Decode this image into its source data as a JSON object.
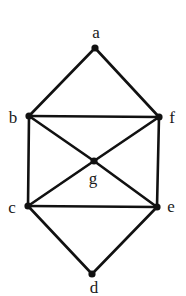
{
  "graph": {
    "colors": {
      "edge": "#111111",
      "node": "#111111",
      "label": "#1a1a1a",
      "background": "#ffffff"
    },
    "nodes": [
      {
        "id": "a",
        "label": "a",
        "x": 95,
        "y": 48,
        "lx": 96,
        "ly": 38
      },
      {
        "id": "b",
        "label": "b",
        "x": 29,
        "y": 116,
        "lx": 13,
        "ly": 123
      },
      {
        "id": "f",
        "label": "f",
        "x": 159,
        "y": 117,
        "lx": 172,
        "ly": 123
      },
      {
        "id": "g",
        "label": "g",
        "x": 94,
        "y": 161,
        "lx": 93,
        "ly": 184
      },
      {
        "id": "c",
        "label": "c",
        "x": 28,
        "y": 206,
        "lx": 12,
        "ly": 213
      },
      {
        "id": "e",
        "label": "e",
        "x": 157,
        "y": 207,
        "lx": 171,
        "ly": 212
      },
      {
        "id": "d",
        "label": "d",
        "x": 92,
        "y": 274,
        "lx": 94,
        "ly": 293
      }
    ],
    "edges": [
      [
        "a",
        "b"
      ],
      [
        "a",
        "f"
      ],
      [
        "b",
        "f"
      ],
      [
        "b",
        "c"
      ],
      [
        "f",
        "e"
      ],
      [
        "b",
        "g"
      ],
      [
        "g",
        "e"
      ],
      [
        "f",
        "g"
      ],
      [
        "g",
        "c"
      ],
      [
        "c",
        "e"
      ],
      [
        "c",
        "d"
      ],
      [
        "e",
        "d"
      ]
    ]
  }
}
